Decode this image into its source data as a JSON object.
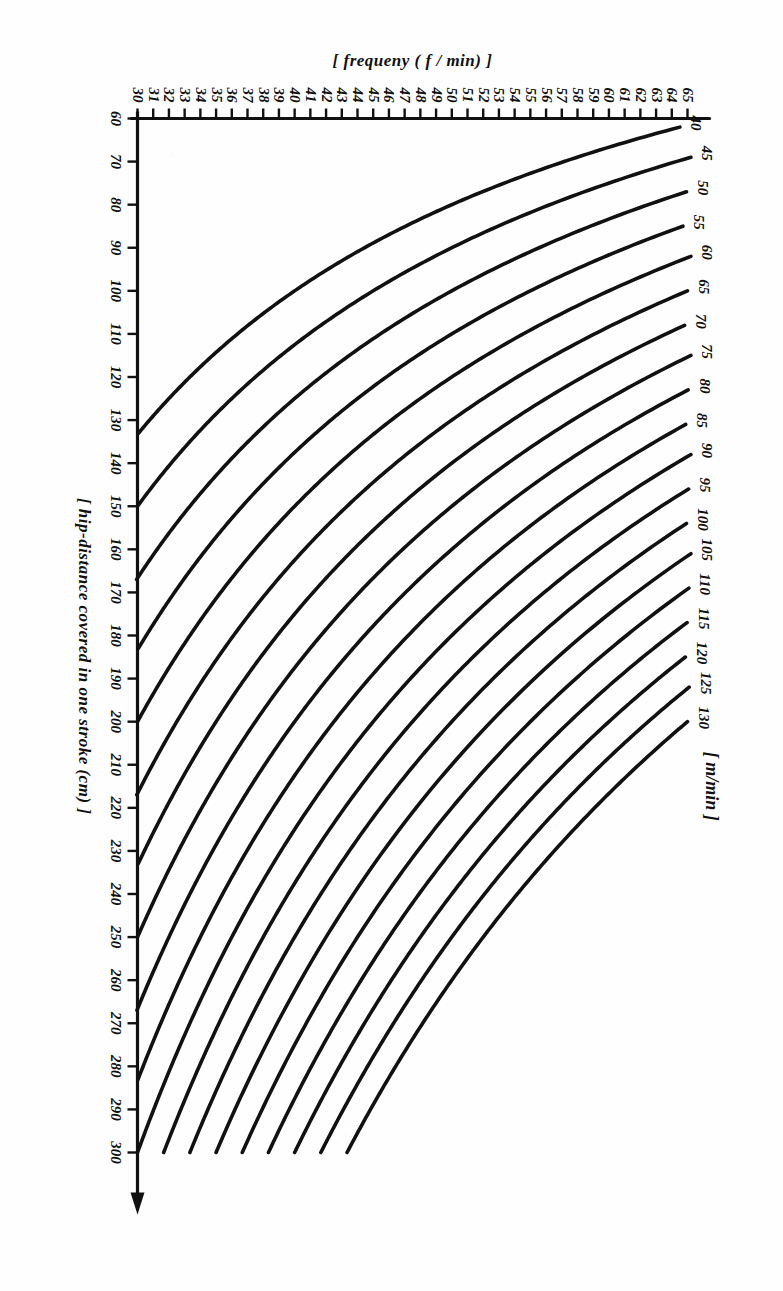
{
  "figure": {
    "kind": "nomogram",
    "background_color": "#fefefe",
    "ink_color": "#111111",
    "rotation_degrees": 90
  },
  "chart_data": {
    "type": "line",
    "title": "",
    "subtitle": "",
    "xlabel": "[ hip-distance covered in one stroke (cm) ]",
    "ylabel": "[ frequeny ( f / min) ]",
    "legend_label": "[ m/min ]",
    "legend_position": "top-left-along-y-axis",
    "grid": false,
    "xlim": [
      60,
      300
    ],
    "ylim": [
      30,
      65
    ],
    "xticks": [
      60,
      70,
      80,
      90,
      100,
      110,
      120,
      130,
      140,
      150,
      160,
      170,
      180,
      190,
      200,
      210,
      220,
      230,
      240,
      250,
      260,
      270,
      280,
      290,
      300
    ],
    "xticklabels": [
      "60",
      "70",
      "80",
      "90",
      "100",
      "110",
      "120",
      "130",
      "140",
      "150",
      "160",
      "170",
      "180",
      "190",
      "200",
      "210",
      "220",
      "230",
      "240",
      "250",
      "260",
      "270",
      "280",
      "290",
      "300"
    ],
    "yticks": [
      30,
      31,
      32,
      33,
      34,
      35,
      36,
      37,
      38,
      39,
      40,
      41,
      42,
      43,
      44,
      45,
      46,
      47,
      48,
      49,
      50,
      51,
      52,
      53,
      54,
      55,
      56,
      57,
      58,
      59,
      60,
      61,
      62,
      63,
      64,
      65
    ],
    "yticklabels": [
      "30",
      "31",
      "32",
      "33",
      "34",
      "35",
      "36",
      "37",
      "38",
      "39",
      "40",
      "41",
      "42",
      "43",
      "44",
      "45",
      "46",
      "47",
      "48",
      "49",
      "50",
      "51",
      "52",
      "53",
      "54",
      "55",
      "56",
      "57",
      "58",
      "59",
      "60",
      "61",
      "62",
      "63",
      "64",
      "65"
    ],
    "relation": "speed (m/min) = hip-distance (cm) / 100 * frequency (f/min)",
    "series": [
      {
        "name": "40",
        "label": "40",
        "speed_m_per_min": 40,
        "x_start": 62,
        "x_end": 133
      },
      {
        "name": "45",
        "label": "45",
        "speed_m_per_min": 45,
        "x_start": 69,
        "x_end": 150
      },
      {
        "name": "50",
        "label": "50",
        "speed_m_per_min": 50,
        "x_start": 77,
        "x_end": 167
      },
      {
        "name": "55",
        "label": "55",
        "speed_m_per_min": 55,
        "x_start": 85,
        "x_end": 183
      },
      {
        "name": "60",
        "label": "60",
        "speed_m_per_min": 60,
        "x_start": 92,
        "x_end": 200
      },
      {
        "name": "65",
        "label": "65",
        "speed_m_per_min": 65,
        "x_start": 100,
        "x_end": 217
      },
      {
        "name": "70",
        "label": "70",
        "speed_m_per_min": 70,
        "x_start": 108,
        "x_end": 233
      },
      {
        "name": "75",
        "label": "75",
        "speed_m_per_min": 75,
        "x_start": 115,
        "x_end": 250
      },
      {
        "name": "80",
        "label": "80",
        "speed_m_per_min": 80,
        "x_start": 123,
        "x_end": 267
      },
      {
        "name": "85",
        "label": "85",
        "speed_m_per_min": 85,
        "x_start": 131,
        "x_end": 283
      },
      {
        "name": "90",
        "label": "90",
        "speed_m_per_min": 90,
        "x_start": 138,
        "x_end": 300
      },
      {
        "name": "95",
        "label": "95",
        "speed_m_per_min": 95,
        "x_start": 146,
        "x_end": 300
      },
      {
        "name": "100",
        "label": "100",
        "speed_m_per_min": 100,
        "x_start": 154,
        "x_end": 300
      },
      {
        "name": "105",
        "label": "105",
        "speed_m_per_min": 105,
        "x_start": 161,
        "x_end": 300
      },
      {
        "name": "110",
        "label": "110",
        "speed_m_per_min": 110,
        "x_start": 169,
        "x_end": 300
      },
      {
        "name": "115",
        "label": "115",
        "speed_m_per_min": 115,
        "x_start": 177,
        "x_end": 300
      },
      {
        "name": "120",
        "label": "120",
        "speed_m_per_min": 120,
        "x_start": 185,
        "x_end": 300
      },
      {
        "name": "125",
        "label": "125",
        "speed_m_per_min": 125,
        "x_start": 192,
        "x_end": 300
      },
      {
        "name": "130",
        "label": "130",
        "speed_m_per_min": 130,
        "x_start": 200,
        "x_end": 300
      }
    ]
  }
}
